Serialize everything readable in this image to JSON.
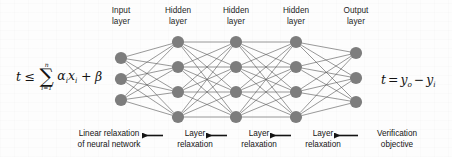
{
  "figure": {
    "background_color": "#fdfdfd",
    "node_color": "#7d7d7d",
    "edge_color": "#595959",
    "text_color": "#141414"
  },
  "layer_captions": [
    {
      "line1": "Input",
      "line2": "layer"
    },
    {
      "line1": "Hidden",
      "line2": "layer"
    },
    {
      "line1": "Hidden",
      "line2": "layer"
    },
    {
      "line1": "Hidden",
      "line2": "layer"
    },
    {
      "line1": "Output",
      "line2": "layer"
    }
  ],
  "network": {
    "layer_node_counts": [
      3,
      4,
      4,
      4,
      3
    ],
    "node_radius": 6.1,
    "layer_x": [
      121,
      178,
      236,
      296,
      356
    ],
    "layer_y": [
      [
        58,
        79,
        100
      ],
      [
        42,
        67,
        92,
        117
      ],
      [
        42,
        67,
        92,
        117
      ],
      [
        42,
        67,
        92,
        117
      ],
      [
        53,
        78,
        102
      ]
    ]
  },
  "formula_left": {
    "lhs": "t",
    "relation": "≤",
    "sum_upper": "n",
    "sum_lower": "i=1",
    "sigma": "∑",
    "term_alpha": "α",
    "term_alpha_sub": "i",
    "term_x": "x",
    "term_x_sub": "i",
    "plus": "+",
    "beta": "β"
  },
  "formula_right": {
    "lhs": "t",
    "relation": "=",
    "term_y_o": "y",
    "term_y_o_sub": "o",
    "minus": "−",
    "term_y_i": "y",
    "term_y_i_sub": "i"
  },
  "pipeline": {
    "direction": "right-to-left",
    "steps": [
      {
        "line1": "Linear relaxation",
        "line2": "of neural network"
      },
      {
        "line1": "Layer",
        "line2": "relaxation"
      },
      {
        "line1": "Layer",
        "line2": "relaxation"
      },
      {
        "line1": "Layer",
        "line2": "relaxation"
      },
      {
        "line1": "Verification",
        "line2": "objective"
      }
    ]
  }
}
